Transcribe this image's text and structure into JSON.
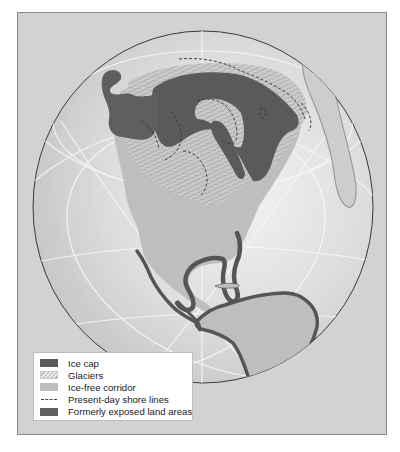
{
  "map": {
    "title": "",
    "region": "North and Central America (Ice Age)",
    "colors": {
      "background": "#d2d2d2",
      "globe_ocean": "#d9d9d9",
      "land": "#bfbfbf",
      "ice_cap": "#5a5a5a",
      "exposed_land": "#5f5f5f",
      "graticule": "#f2f2f2",
      "shoreline": "#333333"
    }
  },
  "legend": {
    "items": [
      {
        "key": "ice-cap",
        "label": "Ice cap"
      },
      {
        "key": "glaciers",
        "label": "Glaciers"
      },
      {
        "key": "ice-free-corridor",
        "label": "Ice-free corridor"
      },
      {
        "key": "present-day-shore-lines",
        "label": "Present-day shore lines"
      },
      {
        "key": "formerly-exposed-land-areas",
        "label": "Formerly exposed land areas"
      }
    ]
  }
}
